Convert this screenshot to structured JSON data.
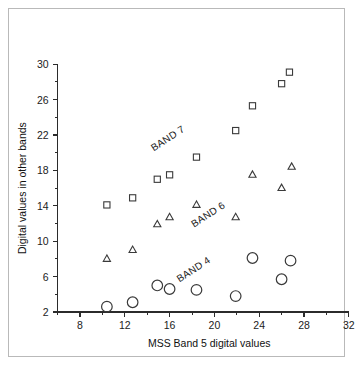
{
  "chart_data": {
    "type": "scatter",
    "title": "",
    "xlabel": "MSS Band 5 digital values",
    "ylabel": "Digital values in other bands",
    "xlim": [
      6,
      32
    ],
    "ylim": [
      2,
      30
    ],
    "xticks": [
      8,
      12,
      16,
      20,
      24,
      28,
      32
    ],
    "xtick_labels": [
      "8",
      "12",
      "16",
      "20",
      "24",
      "28",
      "32"
    ],
    "xminor_step": 2,
    "yticks": [
      2,
      6,
      10,
      14,
      18,
      22,
      26,
      30
    ],
    "ytick_labels": [
      "2",
      "6",
      "10",
      "14",
      "18",
      "22",
      "26",
      "30"
    ],
    "yminor_step": 2,
    "grid": false,
    "legend_position": "inline-annotations",
    "series": [
      {
        "name": "BAND 7",
        "marker": "square",
        "annotation": "BAND 7",
        "annotation_x": 16.0,
        "annotation_y": 21.3,
        "annotation_rotation": -33,
        "points": [
          {
            "x": 10.4,
            "y": 14.1
          },
          {
            "x": 12.7,
            "y": 14.9
          },
          {
            "x": 14.9,
            "y": 17.0
          },
          {
            "x": 16.0,
            "y": 17.5
          },
          {
            "x": 18.4,
            "y": 19.5
          },
          {
            "x": 21.9,
            "y": 22.5
          },
          {
            "x": 23.4,
            "y": 25.3
          },
          {
            "x": 26.0,
            "y": 27.8
          },
          {
            "x": 26.7,
            "y": 29.1
          }
        ]
      },
      {
        "name": "BAND 6",
        "marker": "triangle",
        "annotation": "BAND 6",
        "annotation_x": 19.6,
        "annotation_y": 12.7,
        "annotation_rotation": -33,
        "points": [
          {
            "x": 10.4,
            "y": 8.0
          },
          {
            "x": 12.7,
            "y": 9.0
          },
          {
            "x": 14.9,
            "y": 11.9
          },
          {
            "x": 16.0,
            "y": 12.7
          },
          {
            "x": 18.4,
            "y": 14.1
          },
          {
            "x": 21.9,
            "y": 12.7
          },
          {
            "x": 23.4,
            "y": 17.5
          },
          {
            "x": 26.0,
            "y": 16.0
          },
          {
            "x": 26.9,
            "y": 18.4
          }
        ]
      },
      {
        "name": "BAND 4",
        "marker": "circle",
        "annotation": "BAND 4",
        "annotation_x": 18.3,
        "annotation_y": 6.5,
        "annotation_rotation": -33,
        "points": [
          {
            "x": 10.4,
            "y": 2.6
          },
          {
            "x": 12.7,
            "y": 3.1
          },
          {
            "x": 14.9,
            "y": 5.0
          },
          {
            "x": 16.0,
            "y": 4.6
          },
          {
            "x": 18.4,
            "y": 4.5
          },
          {
            "x": 21.9,
            "y": 3.8
          },
          {
            "x": 23.4,
            "y": 8.1
          },
          {
            "x": 26.0,
            "y": 5.7
          },
          {
            "x": 26.8,
            "y": 7.8
          }
        ]
      }
    ]
  }
}
